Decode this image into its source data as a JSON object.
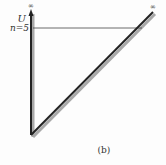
{
  "diagram": {
    "axis_label": "U",
    "level_label": "n=5",
    "top_left_symbol": "∞",
    "top_right_symbol": "∞",
    "caption": "(b)",
    "colors": {
      "line": "#222222",
      "shadow": "#9a9a9a",
      "text": "#333333"
    }
  }
}
